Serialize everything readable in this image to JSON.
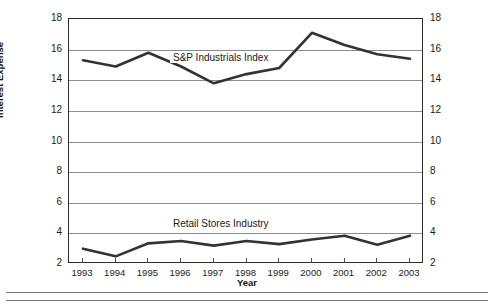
{
  "chart_data": {
    "type": "line",
    "title": "",
    "xlabel": "Year",
    "ylabel": "Interest Expense",
    "categories": [
      "1993",
      "1994",
      "1995",
      "1996",
      "1997",
      "1998",
      "1999",
      "2000",
      "2001",
      "2002",
      "2003"
    ],
    "x": [
      1993,
      1994,
      1995,
      1996,
      1997,
      1998,
      1999,
      2000,
      2001,
      2002,
      2003
    ],
    "ylim": [
      2,
      18
    ],
    "yticks": [
      2,
      4,
      6,
      8,
      10,
      12,
      14,
      16,
      18
    ],
    "right_axis_ylabel": "",
    "right_yticks": [
      2,
      4,
      6,
      8,
      10,
      12,
      14,
      16,
      18
    ],
    "grid": true,
    "legend_position": "inline-labels",
    "series": [
      {
        "name": "S&P Industrials Index",
        "values": [
          15.3,
          14.9,
          15.8,
          14.9,
          13.8,
          14.4,
          14.8,
          17.1,
          16.3,
          15.7,
          15.4
        ],
        "color": "#333333"
      },
      {
        "name": "Retail Stores Industry",
        "values": [
          3.0,
          2.5,
          3.35,
          3.5,
          3.2,
          3.5,
          3.3,
          3.6,
          3.85,
          3.25,
          3.85
        ],
        "color": "#333333"
      }
    ],
    "annotations": [
      {
        "text": "S&P Industrials Index",
        "series": "S&P Industrials Index"
      },
      {
        "text": "Retail Stores Industry",
        "series": "Retail Stores Industry"
      }
    ]
  },
  "axis": {
    "left_ticks": [
      "18",
      "16",
      "14",
      "12",
      "10",
      "8",
      "6",
      "4",
      "2"
    ],
    "right_ticks": [
      "18",
      "16",
      "14",
      "12",
      "10",
      "8",
      "6",
      "4",
      "2"
    ],
    "x_ticks": [
      "1993",
      "1994",
      "1995",
      "1996",
      "1997",
      "1998",
      "1999",
      "2000",
      "2001",
      "2002",
      "2003"
    ],
    "y_title": "Interest Expense",
    "x_title": "Year"
  },
  "labels": {
    "sp": "S&P Industrials Index",
    "retail": "Retail Stores Industry"
  },
  "colors": {
    "line": "#333333",
    "grid": "#8d8d8d",
    "frame": "#2b2b2b",
    "text": "#1a1a1a"
  }
}
